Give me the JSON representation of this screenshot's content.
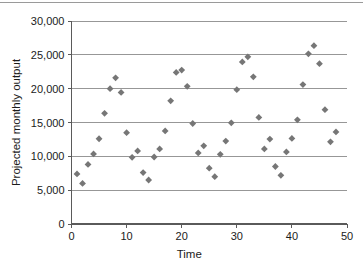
{
  "figure": {
    "name": "projected-monthly-output-scatter",
    "background_color": "#ffffff",
    "has_top_page_rule": true
  },
  "chart_data": {
    "type": "scatter",
    "title": "",
    "xlabel": "Time",
    "ylabel": "Projected monthly output",
    "xlim": [
      0,
      50
    ],
    "ylim": [
      0,
      30000
    ],
    "xticks": [
      0,
      10,
      20,
      30,
      40,
      50
    ],
    "xtick_labels": [
      "0",
      "10",
      "20",
      "30",
      "40",
      "50"
    ],
    "yticks": [
      0,
      5000,
      10000,
      15000,
      20000,
      25000,
      30000
    ],
    "ytick_labels": [
      "0",
      "5,000",
      "10,000",
      "15,000",
      "20,000",
      "25,000",
      "30,000"
    ],
    "grid": {
      "horizontal": true,
      "vertical": false,
      "color": "#8c8c8c"
    },
    "legend": {
      "visible": false,
      "position": "none"
    },
    "marker": {
      "shape": "diamond",
      "color": "#767676",
      "size_px": 5.4
    },
    "series": [
      {
        "name": "Projected monthly output",
        "points": [
          {
            "x": 1,
            "y": 7400
          },
          {
            "x": 2,
            "y": 6000
          },
          {
            "x": 3,
            "y": 8800
          },
          {
            "x": 4,
            "y": 10350
          },
          {
            "x": 5,
            "y": 12600
          },
          {
            "x": 6,
            "y": 16350
          },
          {
            "x": 7,
            "y": 20000
          },
          {
            "x": 8,
            "y": 21600
          },
          {
            "x": 9,
            "y": 19450
          },
          {
            "x": 10,
            "y": 13500
          },
          {
            "x": 11,
            "y": 9850
          },
          {
            "x": 12,
            "y": 10800
          },
          {
            "x": 13,
            "y": 7600
          },
          {
            "x": 14,
            "y": 6500
          },
          {
            "x": 15,
            "y": 9900
          },
          {
            "x": 16,
            "y": 11100
          },
          {
            "x": 17,
            "y": 13750
          },
          {
            "x": 18,
            "y": 18200
          },
          {
            "x": 19,
            "y": 22400
          },
          {
            "x": 20,
            "y": 22750
          },
          {
            "x": 21,
            "y": 20350
          },
          {
            "x": 22,
            "y": 14850
          },
          {
            "x": 23,
            "y": 10500
          },
          {
            "x": 24,
            "y": 11550
          },
          {
            "x": 25,
            "y": 8250
          },
          {
            "x": 26,
            "y": 7000
          },
          {
            "x": 27,
            "y": 10300
          },
          {
            "x": 28,
            "y": 12250
          },
          {
            "x": 29,
            "y": 14950
          },
          {
            "x": 30,
            "y": 19850
          },
          {
            "x": 31,
            "y": 23950
          },
          {
            "x": 32,
            "y": 24700
          },
          {
            "x": 33,
            "y": 21750
          },
          {
            "x": 34,
            "y": 15750
          },
          {
            "x": 35,
            "y": 11100
          },
          {
            "x": 36,
            "y": 12550
          },
          {
            "x": 37,
            "y": 8500
          },
          {
            "x": 38,
            "y": 7200
          },
          {
            "x": 39,
            "y": 10650
          },
          {
            "x": 40,
            "y": 12650
          },
          {
            "x": 41,
            "y": 15400
          },
          {
            "x": 42,
            "y": 20600
          },
          {
            "x": 43,
            "y": 25150
          },
          {
            "x": 44,
            "y": 26350
          },
          {
            "x": 45,
            "y": 23700
          },
          {
            "x": 46,
            "y": 16900
          },
          {
            "x": 47,
            "y": 12150
          },
          {
            "x": 48,
            "y": 13600
          }
        ]
      }
    ]
  }
}
